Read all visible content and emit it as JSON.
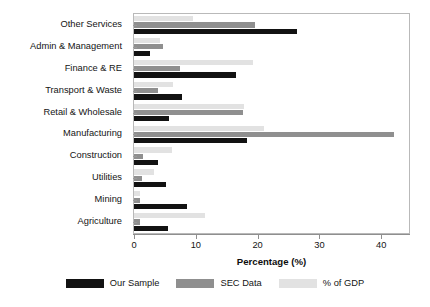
{
  "chart_data": {
    "type": "bar",
    "orientation": "horizontal",
    "title": "",
    "xlabel": "Percentage (%)",
    "ylabel": "",
    "xlim": [
      0,
      44.5
    ],
    "xticks": [
      0,
      10,
      20,
      30,
      40
    ],
    "grid": false,
    "legend_position": "bottom",
    "categories": [
      "Other Services",
      "Admin & Management",
      "Finance & RE",
      "Transport & Waste",
      "Retail & Wholesale",
      "Manufacturing",
      "Construction",
      "Utilities",
      "Mining",
      "Agriculture"
    ],
    "series": [
      {
        "name": "Our Sample",
        "color": "#121212",
        "values": [
          26.4,
          2.6,
          16.5,
          7.7,
          5.6,
          18.3,
          3.9,
          5.1,
          8.5,
          5.5
        ]
      },
      {
        "name": "SEC Data",
        "color": "#8f8f8f",
        "values": [
          19.6,
          4.7,
          7.4,
          3.9,
          17.7,
          42.0,
          1.5,
          1.3,
          0.9,
          0.9
        ]
      },
      {
        "name": "% of GDP",
        "color": "#e2e2e2",
        "values": [
          9.6,
          4.2,
          19.3,
          6.3,
          17.8,
          21.0,
          6.2,
          3.2,
          0.9,
          11.5
        ]
      }
    ]
  },
  "axis": {
    "x_tick_labels": [
      "0",
      "10",
      "20",
      "30",
      "40"
    ],
    "x_title": "Percentage (%)"
  },
  "legend": {
    "items": [
      {
        "label": "Our Sample",
        "color": "#121212"
      },
      {
        "label": "SEC Data",
        "color": "#8f8f8f"
      },
      {
        "label": "% of GDP",
        "color": "#e2e2e2"
      }
    ]
  }
}
